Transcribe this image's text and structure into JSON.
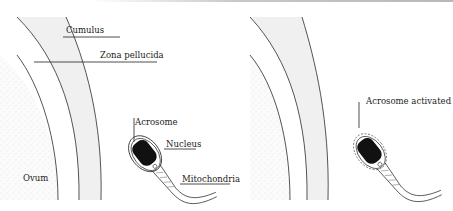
{
  "panels": [
    {
      "id": "before",
      "labels": {
        "cumulus": "Cumulus",
        "zona": "Zona pellucida",
        "acrosome": "Acrosome",
        "nucleus": "Nucleus",
        "mitochondria": "Mitochondria",
        "ovum": "Ovum"
      }
    },
    {
      "id": "after",
      "labels": {
        "acrosome_activated": "Acrosome activated"
      }
    }
  ],
  "colors": {
    "line": "#2a2a2a",
    "zona_fill": "#f1f1f1",
    "nucleus": "#111111",
    "stipple": "#d9d9d9"
  }
}
